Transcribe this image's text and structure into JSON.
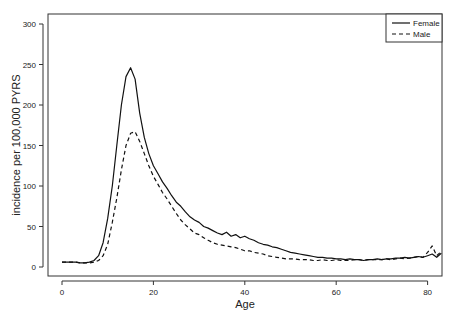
{
  "chart_data": {
    "type": "line",
    "title": "",
    "xlabel": "Age",
    "ylabel": "incidence per 100,000 PYRS",
    "xlim": [
      -2,
      84
    ],
    "ylim": [
      -10,
      310
    ],
    "xticks": [
      0,
      20,
      40,
      60,
      80
    ],
    "yticks": [
      0,
      50,
      100,
      150,
      200,
      250,
      300
    ],
    "grid": false,
    "legend_position": "top-right",
    "x": [
      0,
      1,
      2,
      3,
      4,
      5,
      6,
      7,
      8,
      9,
      10,
      11,
      12,
      13,
      14,
      15,
      16,
      17,
      18,
      19,
      20,
      21,
      22,
      23,
      24,
      25,
      26,
      27,
      28,
      29,
      30,
      31,
      32,
      33,
      34,
      35,
      36,
      37,
      38,
      39,
      40,
      41,
      42,
      43,
      44,
      45,
      46,
      47,
      48,
      49,
      50,
      51,
      52,
      53,
      54,
      55,
      56,
      57,
      58,
      59,
      60,
      61,
      62,
      63,
      64,
      65,
      66,
      67,
      68,
      69,
      70,
      71,
      72,
      73,
      74,
      75,
      76,
      77,
      78,
      79,
      80,
      81,
      82,
      83
    ],
    "series": [
      {
        "name": "Female",
        "style": "solid",
        "values": [
          6,
          6,
          6,
          6,
          5,
          5,
          6,
          8,
          14,
          30,
          60,
          100,
          150,
          200,
          235,
          246,
          232,
          190,
          160,
          140,
          125,
          115,
          105,
          97,
          88,
          80,
          75,
          68,
          62,
          58,
          55,
          50,
          48,
          45,
          42,
          40,
          43,
          38,
          40,
          36,
          38,
          35,
          33,
          30,
          28,
          27,
          25,
          24,
          22,
          20,
          18,
          17,
          16,
          15,
          14,
          13,
          12,
          12,
          11,
          11,
          10,
          10,
          9,
          10,
          9,
          9,
          8,
          9,
          9,
          10,
          9,
          10,
          10,
          11,
          11,
          12,
          11,
          12,
          13,
          12,
          14,
          16,
          12,
          17
        ]
      },
      {
        "name": "Male",
        "style": "dashed",
        "values": [
          6,
          6,
          6,
          6,
          5,
          5,
          5,
          6,
          8,
          14,
          28,
          55,
          85,
          120,
          150,
          165,
          167,
          155,
          140,
          125,
          112,
          102,
          92,
          84,
          75,
          66,
          58,
          52,
          47,
          42,
          40,
          36,
          33,
          30,
          28,
          27,
          26,
          25,
          24,
          22,
          20,
          20,
          18,
          17,
          16,
          14,
          13,
          12,
          11,
          10,
          10,
          10,
          9,
          9,
          9,
          8,
          8,
          9,
          8,
          8,
          9,
          8,
          8,
          8,
          9,
          9,
          8,
          9,
          9,
          9,
          9,
          10,
          9,
          10,
          11,
          10,
          11,
          12,
          13,
          12,
          18,
          26,
          14,
          19
        ]
      }
    ]
  },
  "axes": {
    "xlabel": "Age",
    "ylabel": "incidence per 100,000 PYRS",
    "xtick_labels": [
      "0",
      "20",
      "40",
      "60",
      "80"
    ],
    "ytick_labels": [
      "0",
      "50",
      "100",
      "150",
      "200",
      "250",
      "300"
    ]
  },
  "legend": {
    "items": [
      {
        "label": "Female",
        "style": "solid"
      },
      {
        "label": "Male",
        "style": "dashed"
      }
    ]
  },
  "colors": {
    "line": "#111111",
    "axis": "#333333",
    "background": "#ffffff"
  }
}
